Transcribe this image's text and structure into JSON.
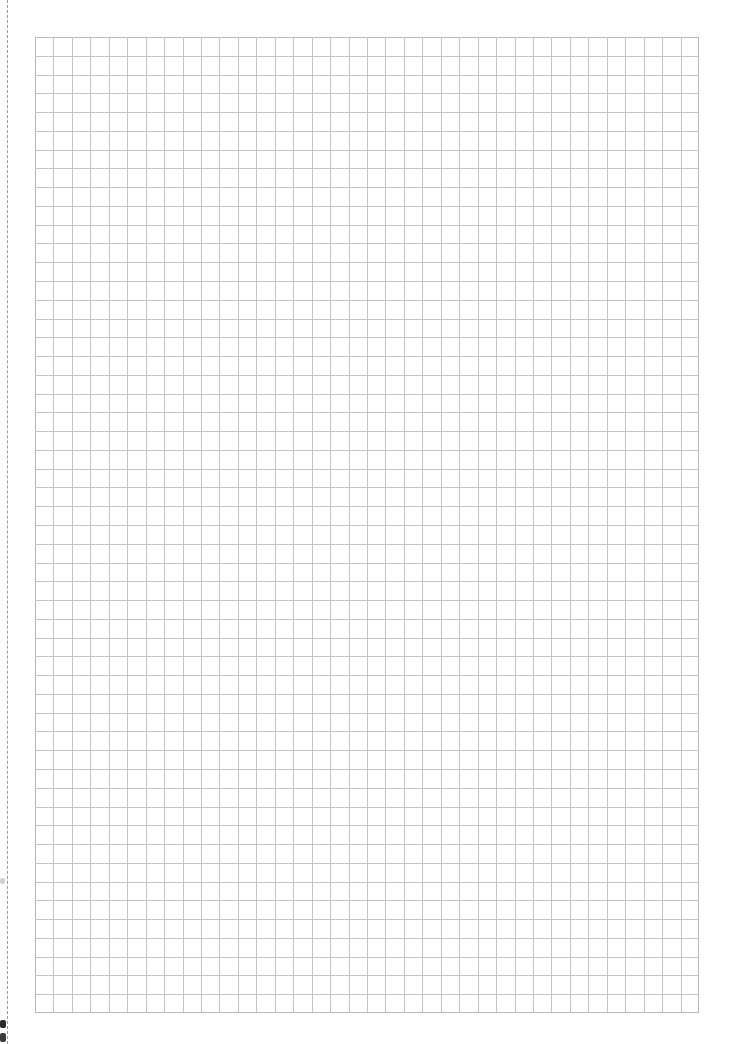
{
  "page": {
    "width": 732,
    "height": 1044,
    "background": "#ffffff"
  },
  "cut_line": {
    "x": 7,
    "style": "dashed",
    "color": "#9a9a9a"
  },
  "grid": {
    "left": 35,
    "top": 37,
    "width": 664,
    "height": 976,
    "columns": 36,
    "rows": 52,
    "line_color": "#c4c4c4",
    "border_color": "#b8b8b8"
  },
  "edge_marks": [
    {
      "x": 0,
      "y": 878,
      "w": 5,
      "h": 6,
      "color": "#d0d0d0"
    },
    {
      "x": 0,
      "y": 1020,
      "w": 6,
      "h": 8,
      "color": "#2a2a2a"
    },
    {
      "x": 0,
      "y": 1033,
      "w": 6,
      "h": 9,
      "color": "#3a3a3a"
    }
  ]
}
